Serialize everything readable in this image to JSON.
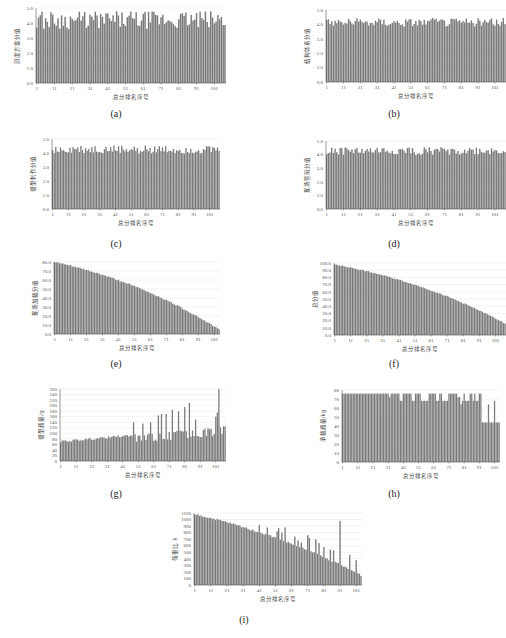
{
  "figure": {
    "bar_color": "#7a7a7a",
    "axis_color": "#555555",
    "grid_color": "#e6e6e6",
    "xlabel": "总分排名序号",
    "x_ticks": [
      "1",
      "11",
      "21",
      "31",
      "41",
      "51",
      "61",
      "71",
      "81",
      "91",
      "101"
    ]
  },
  "chart_data": [
    {
      "id": "a",
      "caption": "(a)",
      "type": "bar",
      "title": "",
      "xlabel": "总分排名序号",
      "ylabel": "测度方案分值",
      "ylim": [
        0,
        5
      ],
      "yticks": [
        "0.0",
        "1.0",
        "2.0",
        "3.0",
        "4.0",
        "5.0"
      ],
      "n": 107,
      "pattern": "noisy",
      "base": 4.2,
      "amp": 0.6,
      "note": "values fluctuate between ~3.5 and ~4.9 with no trend"
    },
    {
      "id": "b",
      "caption": "(b)",
      "type": "bar",
      "title": "",
      "xlabel": "总分排名序号",
      "ylabel": "结构体系分值",
      "ylim": [
        0,
        5
      ],
      "yticks": [
        "0.0",
        "1.0",
        "2.0",
        "3.0",
        "4.0",
        "5.0"
      ],
      "n": 107,
      "pattern": "noisy",
      "base": 4.15,
      "amp": 0.3,
      "note": "values fluctuate between ~3.8 and ~4.7"
    },
    {
      "id": "c",
      "caption": "(c)",
      "type": "bar",
      "title": "",
      "xlabel": "总分排名序号",
      "ylabel": "模型制作分值",
      "ylim": [
        0,
        5
      ],
      "yticks": [
        "0.0",
        "1.0",
        "2.0",
        "3.0",
        "4.0",
        "5.0"
      ],
      "n": 107,
      "pattern": "noisy",
      "base": 4.25,
      "amp": 0.3,
      "note": "values fluctuate between ~3.8 and ~4.8"
    },
    {
      "id": "d",
      "caption": "(d)",
      "type": "bar",
      "title": "",
      "xlabel": "总分排名序号",
      "ylabel": "现场答辩分值",
      "ylim": [
        0,
        5
      ],
      "yticks": [
        "0.0",
        "1.0",
        "2.0",
        "3.0",
        "4.0",
        "5.0"
      ],
      "n": 107,
      "pattern": "noisy",
      "base": 4.25,
      "amp": 0.3,
      "note": "values fluctuate between ~3.8 and ~4.8"
    },
    {
      "id": "e",
      "caption": "(e)",
      "type": "bar",
      "title": "",
      "xlabel": "总分排名序号",
      "ylabel": "现场加载分值",
      "ylim": [
        0,
        80
      ],
      "yticks": [
        "0.0",
        "10.0",
        "20.0",
        "30.0",
        "40.0",
        "50.0",
        "60.0",
        "70.0",
        "80.0"
      ],
      "n": 104,
      "pattern": "descending",
      "start": 80,
      "end": 5,
      "note": "monotonically decreasing from ~80 to ~5"
    },
    {
      "id": "f",
      "caption": "(f)",
      "type": "bar",
      "title": "",
      "xlabel": "总分排名序号",
      "ylabel": "总分值",
      "ylim": [
        0,
        100
      ],
      "yticks": [
        "0.0",
        "10.0",
        "20.0",
        "30.0",
        "40.0",
        "50.0",
        "60.0",
        "70.0",
        "80.0",
        "90.0",
        "100.0"
      ],
      "n": 107,
      "pattern": "descending",
      "start": 98,
      "end": 16,
      "note": "monotonically decreasing from ~98 to ~16"
    },
    {
      "id": "g",
      "caption": "(g)",
      "type": "bar",
      "title": "",
      "xlabel": "总分排名序号",
      "ylabel": "模型质量/g",
      "ylim": [
        0,
        260
      ],
      "yticks": [
        "0",
        "20",
        "40",
        "60",
        "80",
        "100",
        "120",
        "140",
        "160",
        "180",
        "200",
        "220",
        "240",
        "260"
      ],
      "n": 107,
      "pattern": "rising_spiky",
      "start": 70,
      "end": 140,
      "spikes": [
        [
          48,
          140
        ],
        [
          54,
          135
        ],
        [
          59,
          140
        ],
        [
          64,
          165
        ],
        [
          66,
          170
        ],
        [
          69,
          170
        ],
        [
          73,
          185
        ],
        [
          77,
          180
        ],
        [
          81,
          195
        ],
        [
          84,
          210
        ],
        [
          88,
          150
        ],
        [
          101,
          160
        ],
        [
          102,
          175
        ],
        [
          103,
          260
        ],
        [
          107,
          125
        ]
      ],
      "note": "general rise from ~70 to ~140 with spikes, max ~260 near 103"
    },
    {
      "id": "h",
      "caption": "(h)",
      "type": "bar",
      "title": "",
      "xlabel": "总分排名序号",
      "ylabel": "承载质量/kg",
      "ylim": [
        0,
        80
      ],
      "yticks": [
        "0",
        "10",
        "20",
        "30",
        "40",
        "50",
        "60",
        "70",
        "80"
      ],
      "n": 104,
      "pattern": "steps",
      "steps": [
        [
          1,
          31,
          76
        ],
        [
          32,
          32,
          72
        ],
        [
          33,
          38,
          76
        ],
        [
          39,
          40,
          68
        ],
        [
          41,
          46,
          76
        ],
        [
          47,
          48,
          68
        ],
        [
          49,
          52,
          76
        ],
        [
          53,
          57,
          68
        ],
        [
          58,
          62,
          76
        ],
        [
          63,
          64,
          68
        ],
        [
          65,
          66,
          76
        ],
        [
          67,
          70,
          68
        ],
        [
          71,
          76,
          76
        ],
        [
          77,
          78,
          72
        ],
        [
          79,
          79,
          64
        ],
        [
          80,
          80,
          68
        ],
        [
          81,
          81,
          76
        ],
        [
          82,
          84,
          68
        ],
        [
          85,
          86,
          76
        ],
        [
          87,
          87,
          68
        ],
        [
          88,
          88,
          76
        ],
        [
          89,
          90,
          68
        ],
        [
          91,
          92,
          76
        ],
        [
          93,
          104,
          44
        ],
        [
          97,
          97,
          64
        ],
        [
          101,
          101,
          68
        ]
      ],
      "note": "mostly ~76 kg, dips to 68/64, drops to ~44 after rank 93"
    },
    {
      "id": "i",
      "caption": "(i)",
      "type": "bar",
      "title": "",
      "xlabel": "总分排名序号",
      "ylabel": "荷重比 λ",
      "ylim": [
        0,
        1100
      ],
      "yticks": [
        "0",
        "100",
        "200",
        "300",
        "400",
        "500",
        "600",
        "700",
        "800",
        "900",
        "1000",
        "1100"
      ],
      "n": 104,
      "pattern": "descending_spiky",
      "start": 1080,
      "end": 150,
      "spikes": [
        [
          41,
          920
        ],
        [
          46,
          880
        ],
        [
          52,
          820
        ],
        [
          53,
          870
        ],
        [
          55,
          800
        ],
        [
          57,
          880
        ],
        [
          63,
          740
        ],
        [
          65,
          680
        ],
        [
          67,
          650
        ],
        [
          71,
          760
        ],
        [
          72,
          720
        ],
        [
          76,
          700
        ],
        [
          78,
          640
        ],
        [
          81,
          580
        ],
        [
          85,
          540
        ],
        [
          87,
          530
        ],
        [
          91,
          980
        ],
        [
          97,
          460
        ],
        [
          101,
          380
        ]
      ],
      "note": "decreasing from ~1080 to ~150 with spikes, notable ~980 at rank 91"
    }
  ],
  "layout": [
    {
      "id": "a",
      "left": 14,
      "top": 8,
      "w": 190,
      "h": 75,
      "cap_x": 116,
      "cap_y": 108
    },
    {
      "id": "b",
      "left": 304,
      "top": 10,
      "w": 180,
      "h": 72,
      "cap_x": 394,
      "cap_y": 108
    },
    {
      "id": "c",
      "left": 30,
      "top": 139,
      "w": 168,
      "h": 70,
      "cap_x": 116,
      "cap_y": 238
    },
    {
      "id": "d",
      "left": 304,
      "top": 141,
      "w": 180,
      "h": 68,
      "cap_x": 394,
      "cap_y": 238
    },
    {
      "id": "e",
      "left": 32,
      "top": 262,
      "w": 166,
      "h": 72,
      "cap_x": 116,
      "cap_y": 358
    },
    {
      "id": "f",
      "left": 312,
      "top": 263,
      "w": 172,
      "h": 72,
      "cap_x": 394,
      "cap_y": 358
    },
    {
      "id": "g",
      "left": 38,
      "top": 389,
      "w": 166,
      "h": 72,
      "cap_x": 116,
      "cap_y": 488
    },
    {
      "id": "h",
      "left": 320,
      "top": 390,
      "w": 158,
      "h": 72,
      "cap_x": 394,
      "cap_y": 488
    },
    {
      "id": "i",
      "left": 172,
      "top": 513,
      "w": 168,
      "h": 72,
      "cap_x": 244,
      "cap_y": 614
    }
  ]
}
